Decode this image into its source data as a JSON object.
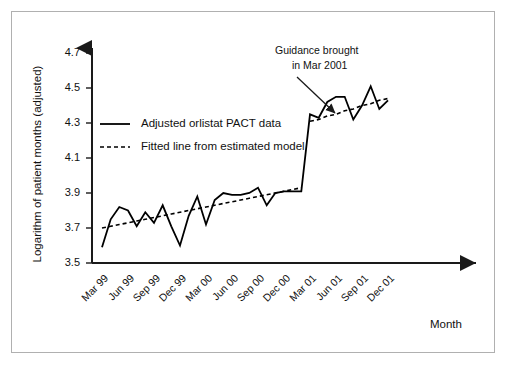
{
  "chart_data": {
    "type": "line",
    "title": "",
    "xlabel": "Month",
    "ylabel": "Logarithm of patient months (adjusted)",
    "ylim": [
      3.5,
      4.7
    ],
    "yticks": [
      "3.5",
      "3.7",
      "3.9",
      "4.1",
      "4.3",
      "4.5",
      "4.7"
    ],
    "ytick_values": [
      3.5,
      3.7,
      3.9,
      4.1,
      4.3,
      4.5,
      4.7
    ],
    "xticks": [
      "Mar 99",
      "Jun 99",
      "Sep 99",
      "Dec 99",
      "Mar 00",
      "Jun 00",
      "Sep 00",
      "Dec 00",
      "Mar 01",
      "Jun 01",
      "Sep 01",
      "Dec 01"
    ],
    "grid": false,
    "legend_position": "upper-left",
    "x": [
      "Mar 99",
      "Apr 99",
      "May 99",
      "Jun 99",
      "Jul 99",
      "Aug 99",
      "Sep 99",
      "Oct 99",
      "Nov 99",
      "Dec 99",
      "Jan 00",
      "Feb 00",
      "Mar 00",
      "Apr 00",
      "May 00",
      "Jun 00",
      "Jul 00",
      "Aug 00",
      "Sep 00",
      "Oct 00",
      "Nov 00",
      "Dec 00",
      "Jan 01",
      "Feb 01",
      "Mar 01",
      "Apr 01",
      "May 01",
      "Jun 01",
      "Jul 01",
      "Aug 01",
      "Sep 01",
      "Oct 01",
      "Nov 01",
      "Dec 01"
    ],
    "series": [
      {
        "name": "Adjusted orlistat PACT data",
        "style": "solid",
        "color": "#000000",
        "values": [
          3.59,
          3.75,
          3.82,
          3.8,
          3.71,
          3.79,
          3.73,
          3.83,
          3.71,
          3.6,
          3.77,
          3.88,
          3.72,
          3.86,
          3.9,
          3.89,
          3.89,
          3.9,
          3.93,
          3.83,
          3.9,
          3.91,
          3.91,
          3.91,
          4.35,
          4.33,
          4.42,
          4.45,
          4.45,
          4.32,
          4.4,
          4.51,
          4.38,
          4.43
        ]
      },
      {
        "name": "Fitted line from estimated model",
        "style": "dotted",
        "color": "#000000",
        "values": [
          3.7,
          3.71,
          3.72,
          3.73,
          3.74,
          3.75,
          3.76,
          3.77,
          3.78,
          3.79,
          3.8,
          3.81,
          3.82,
          3.83,
          3.84,
          3.85,
          3.86,
          3.87,
          3.88,
          3.89,
          3.9,
          3.91,
          3.92,
          3.93,
          4.31,
          4.32,
          4.34,
          4.35,
          4.37,
          4.38,
          4.4,
          4.41,
          4.43,
          4.44
        ]
      }
    ],
    "annotations": [
      {
        "name": "guidance-annotation",
        "line1": "Guidance brought",
        "line2": "in Mar 2001",
        "points_to": "Mar 01"
      }
    ]
  },
  "legend": {
    "items": [
      {
        "label": "Adjusted orlistat PACT data",
        "style": "solid"
      },
      {
        "label": "Fitted line from estimated model",
        "style": "dotted"
      }
    ]
  },
  "axes": {
    "y_title": "Logarithm of patient months (adjusted)",
    "x_title": "Month"
  }
}
